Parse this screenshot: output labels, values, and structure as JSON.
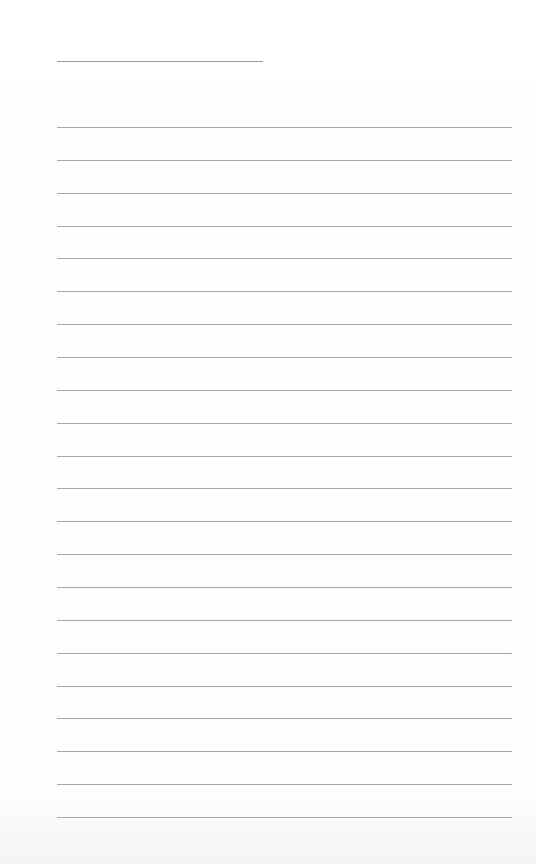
{
  "page": {
    "type": "blank lined paper",
    "title_line": {
      "present": true
    },
    "ruled_lines": {
      "count": 22,
      "first_y": 127,
      "spacing": 32.86
    },
    "colors": {
      "paper": "#ffffff",
      "line": "#a8a8a8"
    }
  }
}
